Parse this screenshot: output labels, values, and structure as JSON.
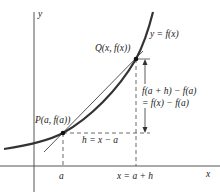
{
  "figure": {
    "axes": {
      "x_label": "x",
      "y_label": "y"
    },
    "curve": {
      "label": "y = f(x)",
      "color": "#333333"
    },
    "points": {
      "P": {
        "label": "P(a, f(a))"
      },
      "Q": {
        "label": "Q(x, f(x))"
      }
    },
    "annotations": {
      "h_label": "h = x − a",
      "rise_label_line1": "f(a + h) − f(a)",
      "rise_label_line2": "= f(x) − f(a)",
      "tick_a": "a",
      "tick_x": "x = a + h"
    }
  }
}
